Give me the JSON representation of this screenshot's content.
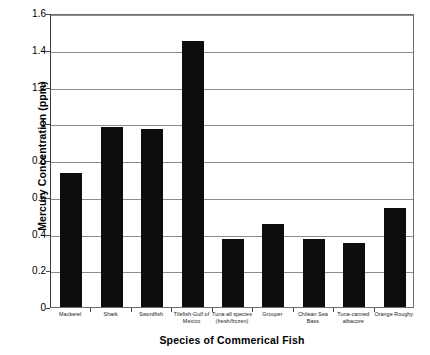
{
  "chart_data": {
    "type": "bar",
    "title": "",
    "xlabel": "Species of Commerical Fish",
    "ylabel": "Mercury Concentration (ppm)",
    "categories": [
      "Mackerel",
      "Shark",
      "Swordfish",
      "Tilefish-Gulf of Mexico",
      "Tuna-all species (fresh/frozen)",
      "Grouper",
      "Chilean Sea Bass",
      "Tuna-canned albacore",
      "Orange Roughy"
    ],
    "category_lines": [
      [
        "Mackerel"
      ],
      [
        "Shark"
      ],
      [
        "Swordfish"
      ],
      [
        "Tilefish-Gulf of",
        "Mexico"
      ],
      [
        "Tuna-all species",
        "(fresh/frozen)"
      ],
      [
        "Grouper"
      ],
      [
        "Chilean Sea",
        "Bass"
      ],
      [
        "Tuna-canned",
        "albacore"
      ],
      [
        "Orange Roughy"
      ]
    ],
    "values": [
      0.73,
      0.98,
      0.97,
      1.45,
      0.37,
      0.45,
      0.37,
      0.35,
      0.54
    ],
    "ylim": [
      0,
      1.6
    ],
    "ytick_values": [
      0,
      0.2,
      0.4,
      0.6,
      0.8,
      1,
      1.2,
      1.4,
      1.6
    ],
    "ytick_labels": [
      "0",
      "0.2",
      "0.4",
      "0.6",
      "0.8",
      "1",
      "1.2",
      "1.4",
      "1.6"
    ],
    "grid": true,
    "legend": false,
    "legend_position": "none",
    "bar_color": "#0d0d0d",
    "grid_color": "#8c8c8c",
    "axis_color": "#3a3a3a",
    "background_color": "#ffffff"
  }
}
